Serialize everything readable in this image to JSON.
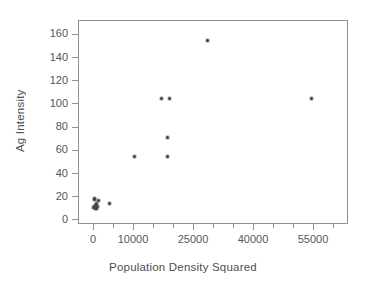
{
  "chart_data": {
    "type": "scatter",
    "title": "",
    "subtitle": "",
    "xlabel": "Population Density Squared",
    "ylabel": "Ag Intensity",
    "xlim": [
      -3750,
      63750
    ],
    "ylim": [
      -4,
      172
    ],
    "grid": false,
    "legend": null,
    "xticks": [
      0,
      10000,
      25000,
      40000,
      55000
    ],
    "xtick_labels": [
      "0",
      "10000",
      "25000",
      "40000",
      "55000"
    ],
    "xticks_minor": [
      5000,
      15000,
      20000,
      30000,
      35000,
      45000,
      50000,
      60000
    ],
    "yticks": [
      0,
      20,
      40,
      60,
      80,
      100,
      120,
      140,
      160
    ],
    "ytick_labels": [
      "0",
      "20",
      "40",
      "60",
      "80",
      "100",
      "120",
      "140",
      "160"
    ],
    "marker": "dot",
    "marker_color": "#3a3a3a",
    "points": [
      {
        "x": 100,
        "y": 10.0
      },
      {
        "x": 250,
        "y": 11.5
      },
      {
        "x": 300,
        "y": 17.5
      },
      {
        "x": 450,
        "y": 18.0
      },
      {
        "x": 500,
        "y": 9.5
      },
      {
        "x": 620,
        "y": 12.0
      },
      {
        "x": 700,
        "y": 10.5
      },
      {
        "x": 850,
        "y": 13.5
      },
      {
        "x": 900,
        "y": 9.0
      },
      {
        "x": 1100,
        "y": 11.0
      },
      {
        "x": 1300,
        "y": 16.5
      },
      {
        "x": 4000,
        "y": 13.5
      },
      {
        "x": 10300,
        "y": 54.5
      },
      {
        "x": 17200,
        "y": 104.0
      },
      {
        "x": 19000,
        "y": 104.0
      },
      {
        "x": 18700,
        "y": 71.0
      },
      {
        "x": 18700,
        "y": 54.5
      },
      {
        "x": 28500,
        "y": 154.5
      },
      {
        "x": 54500,
        "y": 104.5
      }
    ]
  },
  "axes": {
    "plot_left_px": 78,
    "plot_top_px": 20,
    "plot_width_px": 270,
    "plot_height_px": 204
  }
}
